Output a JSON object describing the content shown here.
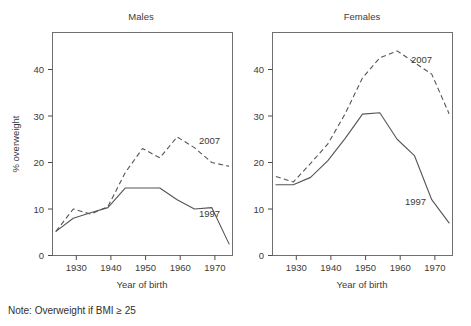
{
  "note": {
    "text": "Note: Overweight if BMI ≥ 25"
  },
  "panels": [
    {
      "key": "males",
      "title": "Males",
      "xlabel": "Year of birth",
      "ylabel": "% overweight",
      "series_labels": {
        "dashed": "2007",
        "solid": "1997"
      }
    },
    {
      "key": "females",
      "title": "Females",
      "xlabel": "Year of birth",
      "ylabel": "",
      "series_labels": {
        "dashed": "2007",
        "solid": "1997"
      }
    }
  ],
  "chart_data": [
    {
      "type": "line",
      "title": "Males",
      "xlabel": "Year of birth",
      "ylabel": "% overweight",
      "xlim": [
        1924,
        1976
      ],
      "ylim": [
        0,
        47
      ],
      "xticks": [
        1930,
        1940,
        1950,
        1960,
        1970
      ],
      "yticks": [
        0,
        10,
        20,
        30,
        40
      ],
      "grid": false,
      "legend": "inline-annotations",
      "x": [
        1925,
        1930,
        1935,
        1940,
        1945,
        1950,
        1955,
        1960,
        1965,
        1970,
        1975
      ],
      "series": [
        {
          "name": "2007",
          "style": "dashed",
          "values": [
            5.2,
            10.0,
            8.9,
            10.5,
            17.8,
            23.0,
            21.0,
            25.5,
            23.2,
            20.0,
            19.2
          ]
        },
        {
          "name": "1997",
          "style": "solid",
          "values": [
            5.2,
            8.0,
            9.2,
            10.3,
            14.5,
            14.5,
            14.5,
            12.0,
            10.0,
            10.3,
            2.5
          ]
        }
      ]
    },
    {
      "type": "line",
      "title": "Females",
      "xlabel": "Year of birth",
      "ylabel": "",
      "xlim": [
        1924,
        1976
      ],
      "ylim": [
        0,
        47
      ],
      "xticks": [
        1930,
        1940,
        1950,
        1960,
        1970
      ],
      "yticks": [
        0,
        10,
        20,
        30,
        40
      ],
      "grid": false,
      "legend": "inline-annotations",
      "x": [
        1925,
        1930,
        1935,
        1940,
        1945,
        1950,
        1955,
        1960,
        1965,
        1970,
        1975
      ],
      "series": [
        {
          "name": "2007",
          "style": "dashed",
          "values": [
            17.0,
            15.8,
            19.8,
            24.0,
            30.5,
            38.2,
            42.5,
            44.0,
            41.5,
            39.0,
            30.5
          ]
        },
        {
          "name": "1997",
          "style": "solid",
          "values": [
            15.2,
            15.2,
            16.8,
            20.4,
            25.2,
            30.4,
            30.7,
            25.0,
            21.5,
            12.0,
            7.0
          ]
        }
      ]
    }
  ]
}
